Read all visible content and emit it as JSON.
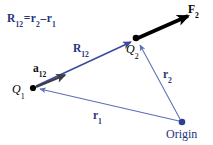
{
  "figure": {
    "background_color": "#ffffff",
    "width": 213,
    "height": 145
  },
  "colors": {
    "vector_blue": "#26347a",
    "line_blue": "#5a6fb5",
    "force_black": "#000000",
    "unit_vector_gray": "#3c3c44",
    "point_black": "#000000",
    "origin_blue": "#2c3f94"
  },
  "labels": {
    "equation": {
      "full": "R12 = r2 - r1",
      "lhs_symbol": "R",
      "lhs_sub": "12",
      "equals": "=",
      "term1_symbol": "r",
      "term1_sub": "2",
      "minus": "–",
      "term2_symbol": "r",
      "term2_sub": "1"
    },
    "force": {
      "symbol": "F",
      "sub": "2",
      "text": "F2"
    },
    "separation_vector": {
      "symbol": "R",
      "sub": "12",
      "text": "R12"
    },
    "unit_vector": {
      "symbol": "a",
      "sub": "12",
      "text": "a12"
    },
    "charge1": {
      "symbol": "Q",
      "sub": "1",
      "text": "Q1"
    },
    "charge2": {
      "symbol": "Q",
      "sub": "2",
      "text": "Q2"
    },
    "position_vector2": {
      "symbol": "r",
      "sub": "2",
      "text": "r2"
    },
    "position_vector1": {
      "symbol": "r",
      "sub": "1",
      "text": "r1"
    },
    "origin": {
      "text": "Origin"
    }
  },
  "points": {
    "q1": {
      "x": 33,
      "y": 88,
      "label": "Q1"
    },
    "q2": {
      "x": 136,
      "y": 39,
      "label": "Q2"
    },
    "origin": {
      "x": 182,
      "y": 122,
      "label": "Origin"
    }
  },
  "vectors": {
    "force_f2": {
      "from": "Q2",
      "to": "tip",
      "x1": 137,
      "y1": 38,
      "x2": 191,
      "y2": 14
    },
    "unit_a12": {
      "from": "Q1",
      "to": "along R12",
      "x1": 36,
      "y1": 87,
      "x2": 68,
      "y2": 74
    },
    "separation_r12": {
      "from": "Q1",
      "to": "Q2",
      "x1": 36,
      "y1": 86,
      "x2": 132,
      "y2": 41
    },
    "position_r2": {
      "from": "Origin",
      "to": "Q2",
      "x1": 180,
      "y1": 120,
      "x2": 139,
      "y2": 44
    },
    "position_r1": {
      "from": "Origin",
      "to": "Q1",
      "x1": 179,
      "y1": 121,
      "x2": 38,
      "y2": 89
    }
  }
}
